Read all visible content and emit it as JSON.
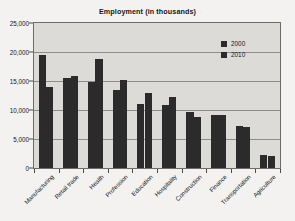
{
  "chart_data": {
    "type": "bar",
    "title": "Employment (in thousands)",
    "xlabel": "",
    "ylabel": "",
    "categories": [
      "Manufacturing",
      "Retail trade",
      "Health",
      "Profession",
      "Education",
      "Hospitality",
      "Construction",
      "Finance",
      "Transportation",
      "Agriculture"
    ],
    "series": [
      {
        "name": "2000",
        "color": "#2b2b2b",
        "values": [
          19500,
          15600,
          14800,
          13500,
          11000,
          10900,
          9700,
          9200,
          7200,
          2300
        ]
      },
      {
        "name": "2010",
        "color": "#2b2b2b",
        "values": [
          13900,
          15800,
          18800,
          15100,
          12900,
          12200,
          8800,
          9200,
          7000,
          2100
        ]
      }
    ],
    "ylim": [
      0,
      25000
    ],
    "ytick_values": [
      0,
      5000,
      10000,
      15000,
      20000,
      25000
    ],
    "ytick_labels": [
      "0",
      "5,000",
      "10,000",
      "15,000",
      "20,000",
      "25,000"
    ],
    "grid": true,
    "legend_position": "inside-top-right",
    "plot_background": "#dcdbd8",
    "figure_background": "#f3f2f0"
  }
}
